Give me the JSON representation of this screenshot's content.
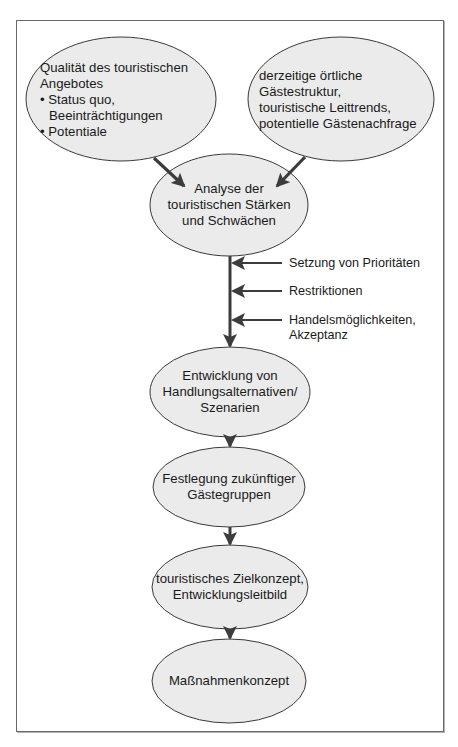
{
  "diagram": {
    "type": "flowchart",
    "colors": {
      "ellipse_fill": "#ebebeb",
      "ellipse_stroke": "#3a3a3a",
      "arrow": "#3c3c3c",
      "frame": "#6a6a6a",
      "background": "#ffffff",
      "text": "#1a1a1a"
    },
    "nodes": {
      "quality": {
        "title_line1": "Qualität des touristischen",
        "title_line2": "Angebotes",
        "bullets": [
          {
            "line1": "Status quo,",
            "line2": "Beeinträchtigungen"
          },
          {
            "line1": "Potentiale"
          }
        ],
        "bullet_char": "•"
      },
      "guests": {
        "lines": [
          "derzeitige örtliche",
          "Gästestruktur,",
          "touristische Leittrends,",
          "potentielle Gästenachfrage"
        ]
      },
      "analysis": {
        "lines": [
          "Analyse der",
          "touristischen Stärken",
          "und Schwächen"
        ]
      },
      "alternatives": {
        "lines": [
          "Entwicklung von",
          "Handlungsalternativen/",
          "Szenarien"
        ]
      },
      "target_groups": {
        "lines": [
          "Festlegung zukünftiger",
          "Gästegruppen"
        ]
      },
      "concept": {
        "lines": [
          "touristisches Zielkonzept,",
          "Entwicklungsleitbild"
        ]
      },
      "measures": {
        "lines": [
          "Maßnahmenkonzept"
        ]
      }
    },
    "side_inputs": [
      {
        "lines": [
          "Setzung von Prioritäten"
        ]
      },
      {
        "lines": [
          "Restriktionen"
        ]
      },
      {
        "lines": [
          "Handelsmöglichkeiten,",
          "Akzeptanz"
        ]
      }
    ],
    "edges": [
      {
        "from": "quality",
        "to": "analysis"
      },
      {
        "from": "guests",
        "to": "analysis"
      },
      {
        "from": "analysis",
        "to": "alternatives"
      },
      {
        "from": "alternatives",
        "to": "target_groups"
      },
      {
        "from": "target_groups",
        "to": "concept"
      },
      {
        "from": "concept",
        "to": "measures"
      }
    ]
  }
}
